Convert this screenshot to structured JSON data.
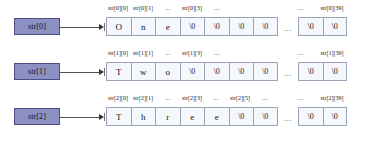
{
  "diagram": {
    "colors": {
      "pointer_box_fill": "#8c90c2",
      "pointer_box_border": "#4a4e86",
      "cell_fill": "#f4f7fb",
      "cell_border": "#9aa3b5",
      "arrow": "#555555",
      "background": "#ffffff"
    },
    "ellipsis": "...",
    "rows": [
      {
        "pointer_label": "str[0]",
        "arrow_name": "arrow-str-0",
        "cells": [
          "O",
          "n",
          "e",
          "\\0",
          "\\0",
          "\\0",
          "\\0"
        ],
        "tail_cells": [
          "\\0",
          "\\0"
        ],
        "labels": [
          {
            "text": "str[0][0]",
            "cell": 0
          },
          {
            "text": "str[0][1]",
            "cell": 1
          },
          {
            "text": "...",
            "cell": 2
          },
          {
            "text": "str[0][3]",
            "cell": 3
          },
          {
            "text": "...",
            "cell": 4
          }
        ],
        "tail_labels": [
          {
            "text": "...",
            "cell": 0
          },
          {
            "text": "str[0][39]",
            "cell": 1
          }
        ]
      },
      {
        "pointer_label": "str[1]",
        "arrow_name": "arrow-str-1",
        "cells": [
          "T",
          "w",
          "o",
          "\\0",
          "\\0",
          "\\0",
          "\\0"
        ],
        "tail_cells": [
          "\\0",
          "\\0"
        ],
        "labels": [
          {
            "text": "str[1][0]",
            "cell": 0
          },
          {
            "text": "str[1][1]",
            "cell": 1
          },
          {
            "text": "...",
            "cell": 2
          },
          {
            "text": "str[1][3]",
            "cell": 3
          },
          {
            "text": "...",
            "cell": 4
          }
        ],
        "tail_labels": [
          {
            "text": "...",
            "cell": 0
          },
          {
            "text": "str[1][39]",
            "cell": 1
          }
        ]
      },
      {
        "pointer_label": "str[2]",
        "arrow_name": "arrow-str-2",
        "cells": [
          "T",
          "h",
          "r",
          "e",
          "e",
          "\\0",
          "\\0"
        ],
        "tail_cells": [
          "\\0",
          "\\0"
        ],
        "labels": [
          {
            "text": "str[2][0]",
            "cell": 0
          },
          {
            "text": "str[2][1]",
            "cell": 1
          },
          {
            "text": "...",
            "cell": 2
          },
          {
            "text": "str[2][3]",
            "cell": 3
          },
          {
            "text": "...",
            "cell": 4
          },
          {
            "text": "str[2][5]",
            "cell": 5
          },
          {
            "text": "...",
            "cell": 6
          }
        ],
        "tail_labels": [
          {
            "text": "...",
            "cell": 0
          },
          {
            "text": "str[2][39]",
            "cell": 1
          }
        ]
      }
    ]
  }
}
